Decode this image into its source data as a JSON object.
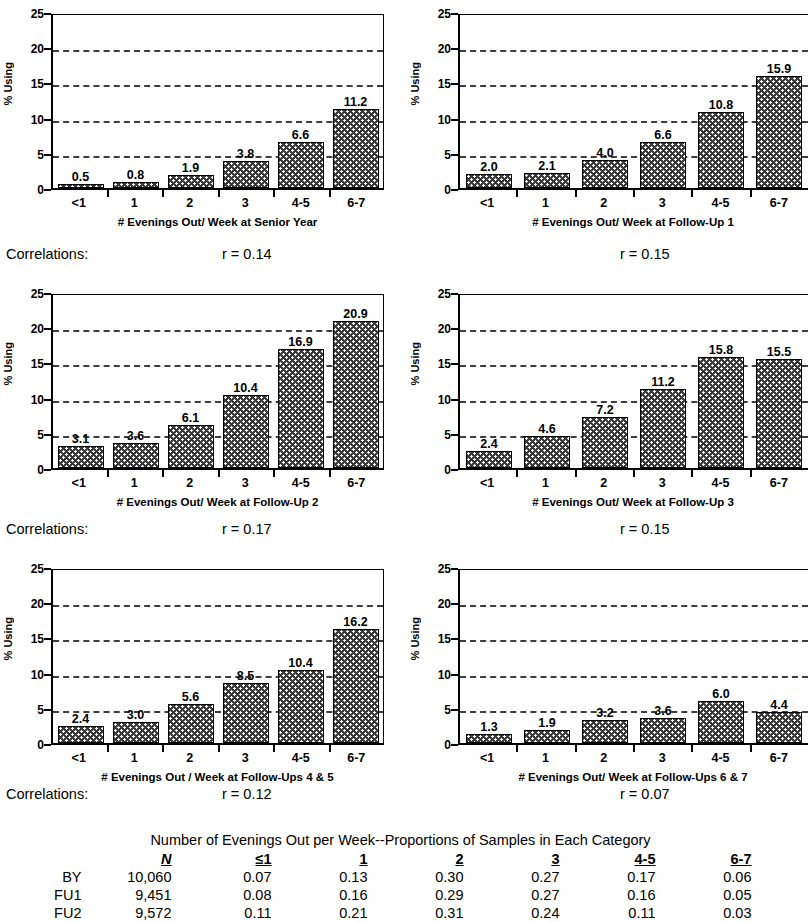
{
  "figure": {
    "correlations_label": "Correlations:",
    "categories": [
      "<1",
      "1",
      "2",
      "3",
      "4-5",
      "6-7"
    ],
    "y_axis_label": "% Using",
    "y_ticks": [
      0,
      5,
      10,
      15,
      20,
      25
    ],
    "y_max": 25
  },
  "charts": [
    {
      "id": "senior-year",
      "xtitle": "# Evenings Out/ Week at Senior Year",
      "values": [
        0.5,
        0.8,
        1.9,
        3.8,
        6.6,
        11.2
      ],
      "labels": [
        "0.5",
        "0.8",
        "1.9",
        "3.8",
        "6.6",
        "11.2"
      ],
      "correlation": "r = 0.14"
    },
    {
      "id": "follow-up-1",
      "xtitle": "# Evenings Out/ Week at Follow-Up 1",
      "values": [
        2.0,
        2.1,
        4.0,
        6.6,
        10.8,
        15.9
      ],
      "labels": [
        "2.0",
        "2.1",
        "4.0",
        "6.6",
        "10.8",
        "15.9"
      ],
      "correlation": "r = 0.15"
    },
    {
      "id": "follow-up-2",
      "xtitle": "# Evenings Out/ Week at Follow-Up 2",
      "values": [
        3.1,
        3.6,
        6.1,
        10.4,
        16.9,
        20.9
      ],
      "labels": [
        "3.1",
        "3.6",
        "6.1",
        "10.4",
        "16.9",
        "20.9"
      ],
      "correlation": "r = 0.17"
    },
    {
      "id": "follow-up-3",
      "xtitle": "# Evenings Out/ Week at Follow-Up 3",
      "values": [
        2.4,
        4.6,
        7.2,
        11.2,
        15.8,
        15.5
      ],
      "labels": [
        "2.4",
        "4.6",
        "7.2",
        "11.2",
        "15.8",
        "15.5"
      ],
      "correlation": "r = 0.15"
    },
    {
      "id": "follow-ups-4-5",
      "xtitle": "# Evenings Out / Week at Follow-Ups 4 & 5",
      "values": [
        2.4,
        3.0,
        5.6,
        8.5,
        10.4,
        16.2
      ],
      "labels": [
        "2.4",
        "3.0",
        "5.6",
        "8.5",
        "10.4",
        "16.2"
      ],
      "correlation": "r = 0.12"
    },
    {
      "id": "follow-ups-6-7",
      "xtitle": "# Evenings Out/ Week at Follow-Ups 6 & 7",
      "values": [
        1.3,
        1.9,
        3.2,
        3.6,
        6.0,
        4.4
      ],
      "labels": [
        "1.3",
        "1.9",
        "3.2",
        "3.6",
        "6.0",
        "4.4"
      ],
      "correlation": "r = 0.07"
    }
  ],
  "table": {
    "title": "Number of Evenings Out per Week--Proportions of Samples in Each Category",
    "headers": [
      "N",
      "≤1",
      "1",
      "2",
      "3",
      "4-5",
      "6-7"
    ],
    "rows": [
      {
        "label": "BY",
        "cells": [
          "10,060",
          "0.07",
          "0.13",
          "0.30",
          "0.27",
          "0.17",
          "0.06"
        ]
      },
      {
        "label": "FU1",
        "cells": [
          "9,451",
          "0.08",
          "0.16",
          "0.29",
          "0.27",
          "0.16",
          "0.05"
        ]
      },
      {
        "label": "FU2",
        "cells": [
          "9,572",
          "0.11",
          "0.21",
          "0.31",
          "0.24",
          "0.11",
          "0.03"
        ]
      }
    ]
  },
  "chart_data": {
    "type": "bar",
    "xlabel": "# Evenings Out per Week",
    "ylabel": "% Using",
    "ylim": [
      0,
      25
    ],
    "yticks": [
      0,
      5,
      10,
      15,
      20,
      25
    ],
    "grid": "horizontal-dashed",
    "legend": "none",
    "categories": [
      "<1",
      "1",
      "2",
      "3",
      "4-5",
      "6-7"
    ],
    "panels": [
      {
        "panel": "# Evenings Out/ Week at Senior Year",
        "values": [
          0.5,
          0.8,
          1.9,
          3.8,
          6.6,
          11.2
        ],
        "correlation": 0.14
      },
      {
        "panel": "# Evenings Out/ Week at Follow-Up 1",
        "values": [
          2.0,
          2.1,
          4.0,
          6.6,
          10.8,
          15.9
        ],
        "correlation": 0.15
      },
      {
        "panel": "# Evenings Out/ Week at Follow-Up 2",
        "values": [
          3.1,
          3.6,
          6.1,
          10.4,
          16.9,
          20.9
        ],
        "correlation": 0.17
      },
      {
        "panel": "# Evenings Out/ Week at Follow-Up 3",
        "values": [
          2.4,
          4.6,
          7.2,
          11.2,
          15.8,
          15.5
        ],
        "correlation": 0.15
      },
      {
        "panel": "# Evenings Out / Week at Follow-Ups 4 & 5",
        "values": [
          2.4,
          3.0,
          5.6,
          8.5,
          10.4,
          16.2
        ],
        "correlation": 0.12
      },
      {
        "panel": "# Evenings Out/ Week at Follow-Ups 6 & 7",
        "values": [
          1.3,
          1.9,
          3.2,
          3.6,
          6.0,
          4.4
        ],
        "correlation": 0.07
      }
    ],
    "table": {
      "title": "Number of Evenings Out per Week--Proportions of Samples in Each Category",
      "columns": [
        "N",
        "≤1",
        "1",
        "2",
        "3",
        "4-5",
        "6-7"
      ],
      "rows": [
        {
          "sample": "BY",
          "N": 10060,
          "proportions": [
            0.07,
            0.13,
            0.3,
            0.27,
            0.17,
            0.06
          ]
        },
        {
          "sample": "FU1",
          "N": 9451,
          "proportions": [
            0.08,
            0.16,
            0.29,
            0.27,
            0.16,
            0.05
          ]
        },
        {
          "sample": "FU2",
          "N": 9572,
          "proportions": [
            0.11,
            0.21,
            0.31,
            0.24,
            0.11,
            0.03
          ]
        }
      ]
    }
  }
}
